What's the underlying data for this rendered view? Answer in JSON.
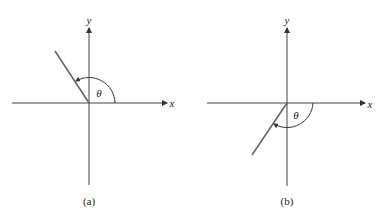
{
  "figure": {
    "panels": [
      {
        "id": "a",
        "caption": "(a)",
        "x_label": "x",
        "y_label": "y",
        "angle_label": "θ",
        "ray_quadrant": "II"
      },
      {
        "id": "b",
        "caption": "(b)",
        "x_label": "x",
        "y_label": "y",
        "angle_label": "θ",
        "ray_quadrant": "III"
      }
    ],
    "colors": {
      "axis": "#333333",
      "ray": "#555555"
    }
  }
}
